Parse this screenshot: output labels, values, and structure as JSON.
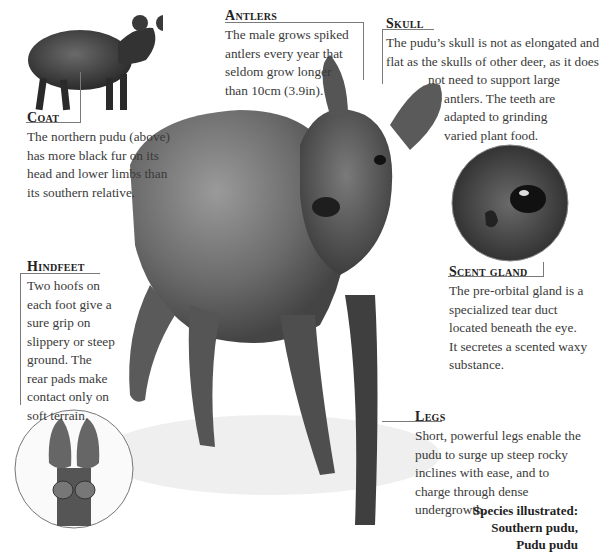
{
  "callouts": {
    "coat": {
      "title": "Coat",
      "text": "The northern pudu (above) has more black fur on its head and lower limbs than its southern relative."
    },
    "antlers": {
      "title": "Antlers",
      "text": "The male grows spiked antlers every year that seldom grow longer than 10cm (3.9in)."
    },
    "skull": {
      "title": "Skull",
      "line1": "The pudu’s skull is not as elongated and",
      "line2": "flat as the skulls of other deer, as it does",
      "line3": "not need to support large",
      "line4": "antlers. The teeth are",
      "line5": "adapted to grinding",
      "line6": "varied plant food."
    },
    "hindfeet": {
      "title": "Hindfeet",
      "text": "Two hoofs on each foot give a sure grip on slippery or steep ground. The rear pads make contact only on soft terrain."
    },
    "scent_gland": {
      "title": "Scent gland",
      "text": "The pre-orbital gland is a specialized tear duct located beneath the eye. It secretes a scented waxy substance."
    },
    "legs": {
      "title": "Legs",
      "text": "Short, powerful legs enable the pudu to surge up steep rocky inclines with ease, and to charge through dense undergrowth."
    }
  },
  "species": {
    "label": "Species illustrated:",
    "common_name": "Southern pudu,",
    "scientific_name": "Pudu pudu"
  },
  "illustrations": {
    "northern_pudu": "northern-pudu-illustration",
    "southern_pudu": "southern-pudu-illustration",
    "eye_detail": "eye-scent-gland-detail",
    "hoof_detail": "hindfoot-hoof-detail"
  }
}
